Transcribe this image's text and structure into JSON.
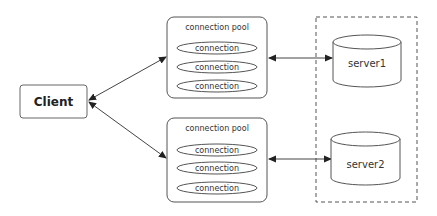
{
  "diagram": {
    "client": {
      "label": "Client"
    },
    "pools": [
      {
        "title": "connection pool",
        "connections": [
          "connection",
          "connection",
          "connection"
        ]
      },
      {
        "title": "connection pool",
        "connections": [
          "connection",
          "connection",
          "connection"
        ]
      }
    ],
    "servers": [
      {
        "label": "server1"
      },
      {
        "label": "server2"
      }
    ],
    "colors": {
      "stroke": "#555555",
      "text": "#333333",
      "background": "#ffffff"
    }
  }
}
